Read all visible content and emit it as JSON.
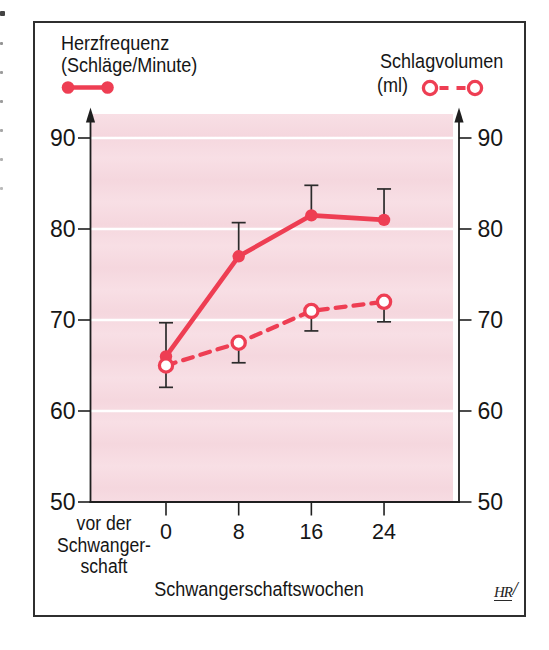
{
  "figure": {
    "legend_heart_rate": {
      "line1": "Herzfrequenz",
      "line2": "(Schläge/Minute)"
    },
    "legend_stroke_volume": {
      "line1": "Schlagvolumen",
      "line2": "(ml)"
    },
    "x_axis_label": "Schwangerschaftswochen",
    "pre_pregnancy_label": [
      "vor der",
      "Schwanger-",
      "schaft"
    ],
    "logo_text": "HR",
    "logo_slash": "/"
  },
  "colors": {
    "accent_red": "#ee3e53",
    "plot_bg": "#f7dbe1",
    "grid": "#ffffff",
    "axis": "#1f1f1f",
    "error_bar": "#2b2b2b",
    "text": "#161616",
    "frame_border": "#2f2f2f"
  },
  "chart_data": {
    "type": "line",
    "title": "",
    "x": [
      0,
      8,
      16,
      24
    ],
    "x_tick_labels": [
      "0",
      "8",
      "16",
      "24"
    ],
    "xlabel": "Schwangerschaftswochen",
    "x_context_label": "vor der Schwangerschaft",
    "yticks": [
      50,
      60,
      70,
      80,
      90
    ],
    "gridlines": [
      60,
      70,
      80,
      90
    ],
    "ylim": [
      50,
      93
    ],
    "dual_axis": true,
    "left_axis_label": "Herzfrequenz (Schläge/Minute)",
    "right_axis_label": "Schlagvolumen (ml)",
    "legend_position": "top",
    "series": [
      {
        "name": "Herzfrequenz (Schläge/Minute)",
        "axis": "left",
        "marker": "filled-circle",
        "line": "solid",
        "values": [
          66,
          77,
          81.5,
          81
        ],
        "err_up": [
          3.7,
          3.7,
          3.3,
          3.4
        ]
      },
      {
        "name": "Schlagvolumen (ml)",
        "axis": "right",
        "marker": "open-circle",
        "line": "dashed",
        "values": [
          65,
          67.5,
          71,
          72
        ],
        "err_down": [
          2.4,
          2.2,
          2.2,
          2.2
        ]
      }
    ]
  }
}
